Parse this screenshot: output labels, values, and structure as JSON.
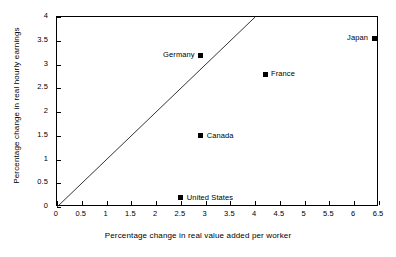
{
  "chart_data": {
    "type": "scatter",
    "title": "",
    "xlabel": "Percentage change in real value added per worker",
    "ylabel": "Percentage change in real hourly earnings",
    "xlim": [
      0,
      6.5
    ],
    "ylim": [
      0,
      4
    ],
    "xticks": [
      "0",
      "0.5",
      "1",
      "1.5",
      "2",
      "2.5",
      "3",
      "3.5",
      "4",
      "4.5",
      "5",
      "5.5",
      "6",
      "6.5"
    ],
    "xtick_values": [
      0,
      0.5,
      1,
      1.5,
      2,
      2.5,
      3,
      3.5,
      4,
      4.5,
      5,
      5.5,
      6,
      6.5
    ],
    "yticks": [
      "0",
      "0.5",
      "1",
      "1.5",
      "2",
      "2.5",
      "3",
      "3.5",
      "4"
    ],
    "ytick_values": [
      0,
      0.5,
      1,
      1.5,
      2,
      2.5,
      3,
      3.5,
      4
    ],
    "grid": false,
    "legend": false,
    "marker_color": "#000000",
    "marker_shape": "square",
    "points": [
      {
        "label": "Germany",
        "x": 2.9,
        "y": 3.2,
        "label_side": "left"
      },
      {
        "label": "Japan",
        "x": 6.4,
        "y": 3.55,
        "label_side": "left"
      },
      {
        "label": "France",
        "x": 4.2,
        "y": 2.8,
        "label_side": "right"
      },
      {
        "label": "Canada",
        "x": 2.9,
        "y": 1.5,
        "label_side": "right"
      },
      {
        "label": "United States",
        "x": 2.5,
        "y": 0.2,
        "label_side": "right"
      }
    ],
    "reference_line": {
      "name": "45-degree identity line",
      "from": [
        0,
        0
      ],
      "to": [
        4,
        4
      ],
      "color": "#000000"
    }
  }
}
